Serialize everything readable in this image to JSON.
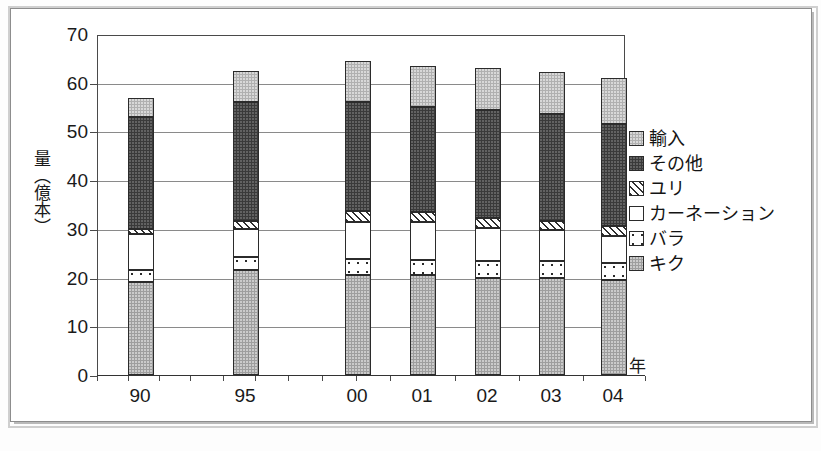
{
  "chart_data": {
    "type": "bar",
    "subtype": "stacked-bar",
    "title": "",
    "xlabel": "年",
    "ylabel": "量（億本）",
    "ylim": [
      0,
      70
    ],
    "yticks": [
      0,
      10,
      20,
      30,
      40,
      50,
      60,
      70
    ],
    "grid": true,
    "legend_position": "right",
    "categories": [
      "90",
      "95",
      "00",
      "01",
      "02",
      "03",
      "04"
    ],
    "series": [
      {
        "name": "キク",
        "values": [
          19.0,
          21.5,
          20.5,
          20.5,
          20.0,
          20.0,
          19.5
        ]
      },
      {
        "name": "バラ",
        "values": [
          2.6,
          2.8,
          3.3,
          3.2,
          3.4,
          3.4,
          3.4
        ]
      },
      {
        "name": "カーネーション",
        "values": [
          7.4,
          5.7,
          7.7,
          7.7,
          6.8,
          6.3,
          5.7
        ]
      },
      {
        "name": "ユリ",
        "values": [
          1.0,
          1.6,
          2.1,
          2.1,
          2.0,
          2.0,
          2.0
        ]
      },
      {
        "name": "その他",
        "values": [
          23.0,
          24.4,
          22.4,
          21.5,
          22.3,
          21.8,
          20.9
        ]
      },
      {
        "name": "輸入",
        "values": [
          3.8,
          6.5,
          8.4,
          8.5,
          8.5,
          8.7,
          9.5
        ]
      }
    ],
    "totals": [
      56.8,
      62.5,
      64.4,
      63.5,
      63.0,
      62.2,
      61.0
    ],
    "stack_order_bottom_to_top": [
      "キク",
      "バラ",
      "カーネーション",
      "ユリ",
      "その他",
      "輸入"
    ]
  },
  "axes": {
    "y_title": "量（億本）",
    "y_ticks": [
      "70",
      "60",
      "50",
      "40",
      "30",
      "20",
      "10",
      "0"
    ],
    "x_title": "年",
    "x_ticks": [
      "90",
      "95",
      "00",
      "01",
      "02",
      "03",
      "04"
    ]
  },
  "legend": {
    "items": [
      {
        "label": "輸入",
        "pattern": "solid-light-gray",
        "color": "#b0b0b0"
      },
      {
        "label": "その他",
        "pattern": "solid-dark-gray",
        "color": "#3a3a3a"
      },
      {
        "label": "ユリ",
        "pattern": "diagonal-hatch",
        "color": "#ffffff"
      },
      {
        "label": "カーネーション",
        "pattern": "solid-white",
        "color": "#ffffff"
      },
      {
        "label": "バラ",
        "pattern": "dotted",
        "color": "#ffffff"
      },
      {
        "label": "キク",
        "pattern": "solid-medium-gray",
        "color": "#9e9e9e"
      }
    ]
  }
}
